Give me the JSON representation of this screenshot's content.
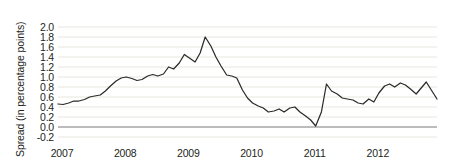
{
  "chart_data": {
    "type": "line",
    "title": "",
    "subtitle": "",
    "xlabel": "",
    "ylabel": "Spread (in percentage points)",
    "xlim": [
      2007.0,
      2013.0
    ],
    "ylim": [
      -0.3,
      2.1
    ],
    "ytick_labels": [
      "2.0",
      "1.8",
      "1.6",
      "1.4",
      "1.2",
      "1.0",
      "0.8",
      "0.6",
      "0.4",
      "0.2",
      "0.0",
      "-0.2"
    ],
    "ytick_values": [
      2.0,
      1.8,
      1.6,
      1.4,
      1.2,
      1.0,
      0.8,
      0.6,
      0.4,
      0.2,
      0.0,
      -0.2
    ],
    "xtick_labels": [
      "2007",
      "2008",
      "2009",
      "2010",
      "2011",
      "2012"
    ],
    "xtick_values": [
      2007,
      2008,
      2009,
      2010,
      2011,
      2012
    ],
    "grid": true,
    "grid_axis": "y",
    "legend": false,
    "legend_position": "none",
    "line_color": "#2b2b2b",
    "grid_color": "#e9e6e0",
    "zero_line_color": "#7a7a78",
    "background_color": "#ffffff",
    "annotations": [],
    "series": [
      {
        "name": "Spread",
        "x": [
          2007.0,
          2007.08,
          2007.17,
          2007.25,
          2007.33,
          2007.42,
          2007.5,
          2007.58,
          2007.67,
          2007.75,
          2007.83,
          2007.92,
          2008.0,
          2008.08,
          2008.17,
          2008.25,
          2008.33,
          2008.42,
          2008.5,
          2008.58,
          2008.67,
          2008.75,
          2008.83,
          2008.92,
          2009.0,
          2009.08,
          2009.17,
          2009.25,
          2009.33,
          2009.42,
          2009.5,
          2009.58,
          2009.67,
          2009.75,
          2009.83,
          2009.92,
          2010.0,
          2010.08,
          2010.17,
          2010.25,
          2010.33,
          2010.42,
          2010.5,
          2010.58,
          2010.67,
          2010.75,
          2010.83,
          2010.92,
          2011.0,
          2011.08,
          2011.17,
          2011.25,
          2011.33,
          2011.42,
          2011.5,
          2011.58,
          2011.67,
          2011.75,
          2011.83,
          2011.92,
          2012.0,
          2012.08,
          2012.17,
          2012.25,
          2012.33,
          2012.42,
          2012.5,
          2012.58,
          2012.67,
          2012.75,
          2012.83,
          2012.92,
          2013.0
        ],
        "values": [
          0.46,
          0.45,
          0.48,
          0.52,
          0.52,
          0.55,
          0.6,
          0.62,
          0.64,
          0.72,
          0.82,
          0.92,
          0.98,
          1.0,
          0.97,
          0.93,
          0.95,
          1.02,
          1.05,
          1.02,
          1.06,
          1.2,
          1.16,
          1.28,
          1.45,
          1.38,
          1.3,
          1.48,
          1.8,
          1.62,
          1.4,
          1.22,
          1.04,
          1.02,
          0.98,
          0.74,
          0.58,
          0.48,
          0.42,
          0.38,
          0.3,
          0.32,
          0.36,
          0.3,
          0.38,
          0.4,
          0.3,
          0.22,
          0.14,
          0.02,
          0.3,
          0.86,
          0.72,
          0.66,
          0.58,
          0.56,
          0.54,
          0.48,
          0.46,
          0.56,
          0.5,
          0.68,
          0.82,
          0.86,
          0.8,
          0.88,
          0.84,
          0.76,
          0.66,
          0.78,
          0.9,
          0.72,
          0.56
        ]
      }
    ]
  },
  "plot_geometry": {
    "left": 58,
    "right": 437,
    "top": 22,
    "bottom": 142
  }
}
